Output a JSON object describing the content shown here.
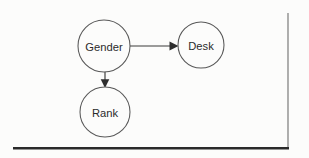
{
  "figure": {
    "type": "directed-graph",
    "background_color": "#fcfcfb",
    "node_stroke_color": "#585858",
    "edge_color": "#3a3a3a",
    "label_color": "#2b2b2b",
    "rule_color": "#2a2a2a"
  },
  "graph": {
    "nodes": [
      {
        "id": "gender",
        "label": "Gender",
        "cx": 104,
        "cy": 46,
        "r": 26
      },
      {
        "id": "desk",
        "label": "Desk",
        "cx": 201,
        "cy": 45,
        "r": 23
      },
      {
        "id": "rank",
        "label": "Rank",
        "cx": 105,
        "cy": 112,
        "r": 25
      }
    ],
    "edges": [
      {
        "id": "gender-to-desk",
        "from": "Gender",
        "to": "Desk",
        "direction": "horizontal",
        "arrowhead": "filled-triangle",
        "x1": 130,
        "y1": 46,
        "x2": 178,
        "y2": 46
      },
      {
        "id": "gender-to-rank",
        "from": "Gender",
        "to": "Rank",
        "direction": "vertical",
        "arrowhead": "filled-triangle",
        "x1": 105,
        "y1": 72,
        "x2": 105,
        "y2": 87
      }
    ]
  },
  "rules": {
    "vertical_border": {
      "x": 288,
      "y_top": 13,
      "y_bottom": 149
    },
    "bottom_border": {
      "y": 148,
      "x_left": 13,
      "x_right": 289
    }
  }
}
